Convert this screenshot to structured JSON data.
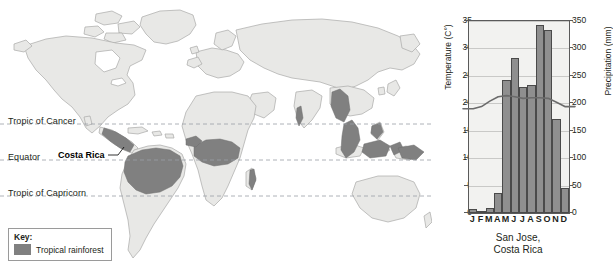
{
  "map": {
    "latitude_lines": [
      {
        "id": "tropic-of-cancer",
        "label": "Tropic of Cancer"
      },
      {
        "id": "equator",
        "label": "Equator"
      },
      {
        "id": "tropic-of-capricorn",
        "label": "Tropic of Capricorn"
      }
    ],
    "annotation": {
      "label": "Costa Rica"
    },
    "key": {
      "title": "Key:",
      "entries": [
        {
          "label": "Tropical rainforest",
          "color": "#808080"
        }
      ]
    },
    "colors": {
      "land": "#e8e8e6",
      "land_outline": "#a9a9a7",
      "rainforest": "#808080",
      "latitude_line": "#9aa0a6",
      "background": "#ffffff"
    }
  },
  "chart_data": {
    "type": "bar",
    "title": "San Jose,\nCosta Rica",
    "title_line1": "San Jose,",
    "title_line2": "Costa Rica",
    "categories": [
      "J",
      "F",
      "M",
      "A",
      "M",
      "J",
      "J",
      "A",
      "S",
      "O",
      "N",
      "D"
    ],
    "month_names": [
      "January",
      "February",
      "March",
      "April",
      "May",
      "June",
      "July",
      "August",
      "September",
      "October",
      "November",
      "December"
    ],
    "xlabel": "",
    "ylabel": "Temperature (C°)",
    "y2label": "Precipitation (mm)",
    "ylim": [
      0,
      35
    ],
    "y2lim": [
      0,
      350
    ],
    "yticks": [
      0,
      5,
      10,
      15,
      20,
      25,
      30,
      35
    ],
    "y2ticks": [
      0,
      50,
      100,
      150,
      200,
      250,
      300,
      350
    ],
    "grid": true,
    "legend": "none",
    "series": [
      {
        "name": "Precipitation (mm)",
        "type": "bar",
        "axis": "right",
        "color": "#8f8f8f",
        "edge_color": "#4a4a4a",
        "values": [
          8,
          4,
          10,
          36,
          243,
          283,
          229,
          233,
          342,
          333,
          172,
          46
        ]
      },
      {
        "name": "Temperature (C°)",
        "type": "line",
        "axis": "left",
        "color": "#6b6b6b",
        "values": [
          19.0,
          19.4,
          20.4,
          21.2,
          21.4,
          21.2,
          20.9,
          21.0,
          21.0,
          20.9,
          20.2,
          19.4
        ]
      }
    ]
  }
}
